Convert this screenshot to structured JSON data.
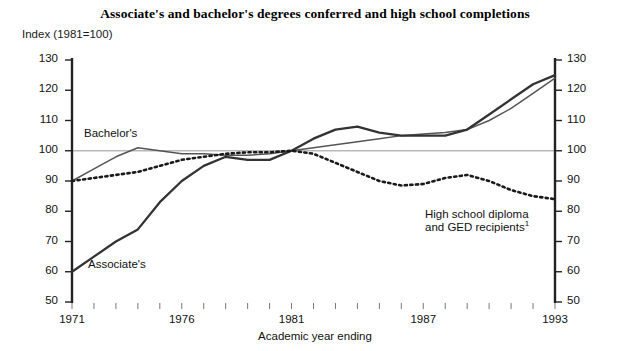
{
  "chart_data": {
    "type": "line",
    "title": "Associate's and bachelor's degrees conferred and high school completions",
    "subtitle": "Index (1981=100)",
    "xlabel": "Academic year ending",
    "ylabel": "Index (1981=100)",
    "xlim": [
      1971,
      1993
    ],
    "ylim": [
      50,
      130
    ],
    "yticks": [
      50,
      60,
      70,
      80,
      90,
      100,
      110,
      120,
      130
    ],
    "xticks": [
      1971,
      1976,
      1981,
      1987,
      1993
    ],
    "xtick_labels": [
      "1971",
      "1976",
      "1981",
      "1987",
      "1993"
    ],
    "ytick_labels_left": [
      "130",
      "120",
      "110",
      "100",
      "90",
      "80",
      "70",
      "60",
      "50"
    ],
    "ytick_labels_right": [
      "130",
      "120",
      "110",
      "100",
      "90",
      "80",
      "70",
      "60",
      "50"
    ],
    "minor_xticks_every": 1,
    "grid": false,
    "reference_line": 100,
    "legend_position": "inline-annotations",
    "dual_y_axis": true,
    "x": [
      1971,
      1972,
      1973,
      1974,
      1975,
      1976,
      1977,
      1978,
      1979,
      1980,
      1981,
      1982,
      1983,
      1984,
      1985,
      1986,
      1987,
      1988,
      1989,
      1990,
      1991,
      1992,
      1993
    ],
    "series": [
      {
        "name": "Associate's",
        "style": "solid-thick",
        "color": "#333333",
        "label": "Associate's",
        "values": [
          60,
          65,
          70,
          74,
          83,
          90,
          95,
          98,
          97,
          97,
          100,
          104,
          107,
          108,
          106,
          105,
          105,
          105,
          107,
          112,
          117,
          122,
          125
        ]
      },
      {
        "name": "Bachelor's",
        "style": "solid-thin",
        "color": "#555555",
        "label": "Bachelor's",
        "values": [
          90,
          94,
          98,
          101,
          100,
          99,
          99,
          98.5,
          98.5,
          99,
          100,
          101,
          102,
          103,
          104,
          105,
          105.5,
          106,
          107,
          110,
          114,
          119,
          124
        ]
      },
      {
        "name": "High school diploma and GED recipients",
        "style": "dotted",
        "color": "#1a1a1a",
        "label": "High school diploma\nand GED recipients",
        "footnote_marker": "1",
        "values": [
          90,
          91,
          92,
          93,
          95,
          97,
          98,
          99,
          99.5,
          99.5,
          100,
          99,
          96,
          93,
          90,
          88.5,
          89,
          91,
          92,
          90,
          87,
          85,
          84
        ]
      }
    ],
    "annotations": [
      {
        "text": "Bachelor's",
        "series": "Bachelor's"
      },
      {
        "text": "Associate's",
        "series": "Associate's"
      },
      {
        "text": "High school diploma",
        "series": "High school diploma and GED recipients"
      },
      {
        "text": "and GED recipients",
        "series": "High school diploma and GED recipients",
        "footnote": "1"
      }
    ]
  },
  "header": {
    "title": "Associate's and bachelor's degrees conferred and high school completions",
    "index_label": "Index (1981=100)"
  },
  "axes": {
    "x_axis_title": "Academic year ending"
  },
  "annotations": {
    "bachelors_label": "Bachelor's",
    "associates_label": "Associate's",
    "hs_line1": "High school diploma",
    "hs_line2": "and GED recipients",
    "hs_footnote": "1"
  },
  "yticks": {
    "t130": "130",
    "t120": "120",
    "t110": "110",
    "t100": "100",
    "t90": "90",
    "t80": "80",
    "t70": "70",
    "t60": "60",
    "t50": "50"
  },
  "xticks": {
    "t1971": "1971",
    "t1976": "1976",
    "t1981": "1981",
    "t1987": "1987",
    "t1993": "1993"
  },
  "colors": {
    "associates": "#333333",
    "bachelors": "#555555",
    "highschool": "#1a1a1a",
    "axis": "#222222",
    "reference_line": "#b9b9b9"
  }
}
